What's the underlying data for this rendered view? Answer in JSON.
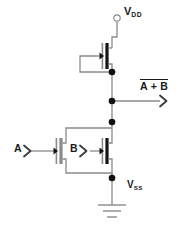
{
  "diagram": {
    "background_color": "#ffffff",
    "wire_color": "#888888",
    "device_color": "#1a1a1a",
    "node_color": "#111111"
  },
  "supplies": {
    "vdd": {
      "symbol": "V",
      "subscript": "DD",
      "terminal": "open-circle"
    },
    "vss": {
      "symbol": "V",
      "subscript": "SS",
      "terminal": "ground"
    }
  },
  "inputs": [
    {
      "id": "a",
      "label": "A",
      "marker": "chevron-right"
    },
    {
      "id": "b",
      "label": "B",
      "marker": "chevron-right"
    }
  ],
  "output": {
    "expression": "A + B",
    "overbar": true,
    "marker": "chevron-right",
    "function": "NOR"
  },
  "transistors": [
    {
      "id": "pmos-1",
      "type": "PMOS",
      "gate_input": "A-B-common",
      "position": "pull-up"
    },
    {
      "id": "nmos-a",
      "type": "NMOS",
      "gate_input": "A",
      "position": "pull-down-left"
    },
    {
      "id": "nmos-b",
      "type": "NMOS",
      "gate_input": "B",
      "position": "pull-down-right"
    }
  ],
  "nodes": [
    {
      "id": "pmos-drain",
      "x": 112,
      "y": 72
    },
    {
      "id": "output-tap",
      "x": 112,
      "y": 101
    },
    {
      "id": "nmos-drain",
      "x": 112,
      "y": 122
    },
    {
      "id": "nmos-source",
      "x": 112,
      "y": 178
    }
  ]
}
